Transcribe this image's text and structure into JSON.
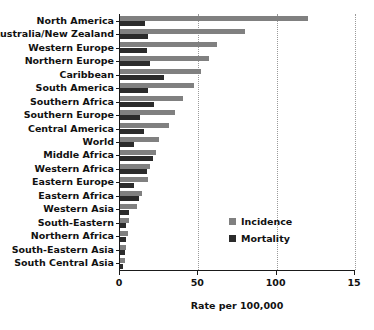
{
  "chart_data": {
    "type": "bar",
    "orientation": "horizontal",
    "title": "",
    "subtitle": "",
    "xlabel": "Rate per 100,000",
    "ylabel": "",
    "xlim": [
      0,
      150
    ],
    "ylim": null,
    "grid": true,
    "grid_axis": "x",
    "legend_position": "center-right",
    "xticks": [
      0,
      50,
      100,
      150
    ],
    "xtick_labels": [
      "0",
      "50",
      "100",
      "15"
    ],
    "xtick_label_note": "final tick label '150' is clipped by the image edge and renders as '15'",
    "categories": [
      "North America",
      "Australia/New Zealand",
      "Western Europe",
      "Northern Europe",
      "Caribbean",
      "South America",
      "Southern Africa",
      "Southern Europe",
      "Central America",
      "World",
      "Middle Africa",
      "Western Africa",
      "Eastern Europe",
      "Eastern Africa",
      "Western Asia",
      "South-Eastern",
      "Northern Africa",
      "South-Eastern Asia",
      "South Central Asia"
    ],
    "series": [
      {
        "name": "Incidence",
        "color": "#808080",
        "values": [
          120,
          80,
          62,
          57,
          52,
          47,
          40,
          35,
          31,
          25,
          23,
          19,
          18,
          14,
          11,
          6,
          5,
          4,
          3
        ]
      },
      {
        "name": "Mortality",
        "color": "#2b2b2b",
        "values": [
          16,
          18,
          17,
          19,
          28,
          18,
          22,
          13,
          15,
          9,
          21,
          17,
          9,
          12,
          6,
          4,
          4,
          3,
          2
        ]
      }
    ]
  },
  "legend": {
    "items": [
      {
        "label": "Incidence",
        "color": "#808080"
      },
      {
        "label": "Mortality",
        "color": "#2b2b2b"
      }
    ]
  }
}
